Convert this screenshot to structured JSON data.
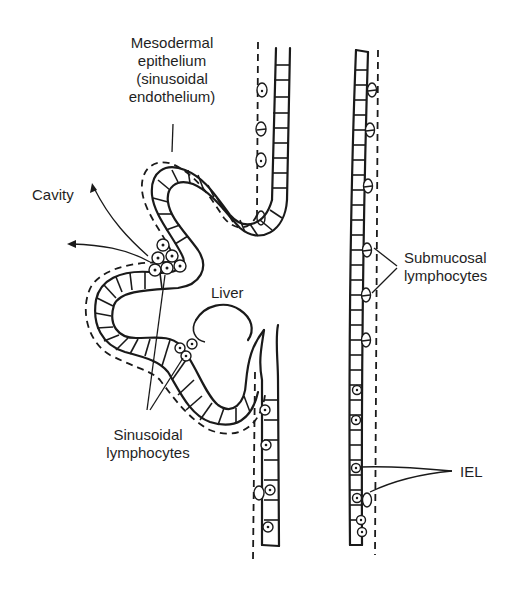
{
  "diagram": {
    "colors": {
      "ink": "#1a1a1a",
      "background": "#ffffff"
    },
    "labels": {
      "mesodermal": [
        "Mesodermal",
        "epithelium",
        "(sinusoidal",
        "endothelium)"
      ],
      "cavity": "Cavity",
      "liver": "Liver",
      "submucosal": [
        "Submucosal",
        "lymphocytes"
      ],
      "sinusoidal": [
        "Sinusoidal",
        "lymphocytes"
      ],
      "iel": "IEL"
    },
    "structures": [
      {
        "name": "liver-bud",
        "description": "Folded mesodermal epithelium outpouching forming liver"
      },
      {
        "name": "left-gut-wall",
        "description": "Columnar epithelial layer with dashed basement boundary"
      },
      {
        "name": "right-gut-wall",
        "description": "Columnar epithelial layer with intraepithelial lymphocytes"
      }
    ]
  }
}
